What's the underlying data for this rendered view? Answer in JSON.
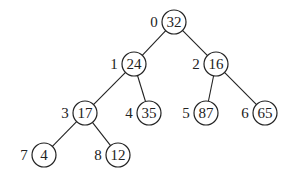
{
  "diagram": {
    "type": "binary-heap-tree",
    "nodes": [
      {
        "index": "0",
        "value": "32",
        "x": 174,
        "y": 22,
        "parent": null
      },
      {
        "index": "1",
        "value": "24",
        "x": 134,
        "y": 64,
        "parent": 0
      },
      {
        "index": "2",
        "value": "16",
        "x": 216,
        "y": 64,
        "parent": 0
      },
      {
        "index": "3",
        "value": "17",
        "x": 85,
        "y": 113,
        "parent": 1
      },
      {
        "index": "4",
        "value": "35",
        "x": 149,
        "y": 113,
        "parent": 1
      },
      {
        "index": "5",
        "value": "87",
        "x": 206,
        "y": 113,
        "parent": 2
      },
      {
        "index": "6",
        "value": "65",
        "x": 265,
        "y": 113,
        "parent": 2
      },
      {
        "index": "7",
        "value": "4",
        "x": 44,
        "y": 155,
        "parent": 3
      },
      {
        "index": "8",
        "value": "12",
        "x": 118,
        "y": 155,
        "parent": 3
      }
    ]
  }
}
